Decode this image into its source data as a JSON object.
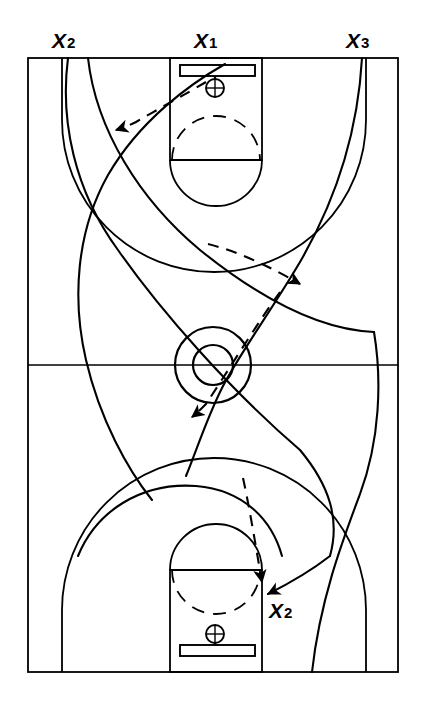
{
  "diagram": {
    "type": "basketball-play-diagram",
    "orientation": "vertical-full-court",
    "line_color": "#000000",
    "background_color": "#ffffff",
    "court": {
      "boundary": {
        "x": 28,
        "y": 58,
        "width": 370,
        "height": 614
      },
      "half_court_line_y": 365,
      "center_circle": {
        "cx": 213,
        "cy": 365,
        "outer_r": 38,
        "inner_r": 20
      },
      "top_basket": {
        "key": {
          "x": 170,
          "y": 58,
          "width": 92,
          "height": 102
        },
        "free_throw_line_y": 160,
        "free_throw_circle": {
          "cx": 216,
          "cy": 160,
          "r": 46
        },
        "backboard": {
          "x": 180,
          "y": 65,
          "width": 75,
          "height": 11
        },
        "hoop": {
          "cx": 215,
          "cy": 88,
          "r": 9
        },
        "three_point_arc": {
          "cx": 214,
          "cy": 80,
          "r": 152
        }
      },
      "bottom_basket": {
        "key": {
          "x": 170,
          "y": 570,
          "width": 92,
          "height": 102
        },
        "free_throw_line_y": 570,
        "free_throw_circle": {
          "cx": 216,
          "cy": 570,
          "r": 46
        },
        "backboard": {
          "x": 180,
          "y": 645,
          "width": 75,
          "height": 11
        },
        "hoop": {
          "cx": 215,
          "cy": 634,
          "r": 9
        },
        "three_point_arc": {
          "cx": 214,
          "cy": 650,
          "r": 152
        }
      }
    },
    "labels": [
      {
        "id": "x2-top",
        "x_text": "X",
        "number": "2",
        "full": "X2",
        "position": "top-left-baseline"
      },
      {
        "id": "x1-top",
        "x_text": "X",
        "number": "1",
        "full": "X1",
        "position": "top-center-baseline"
      },
      {
        "id": "x3-top",
        "x_text": "X",
        "number": "3",
        "full": "X3",
        "position": "top-right-baseline"
      },
      {
        "id": "x2-bottom",
        "x_text": "X",
        "number": "2",
        "full": "X2",
        "position": "bottom-right-key"
      }
    ],
    "movement_paths": [
      {
        "id": "path-x2-a",
        "style": "solid",
        "description": "X2 cut from top-left baseline sweeping down and right across the court"
      },
      {
        "id": "path-x2-b",
        "style": "solid",
        "description": "X2 second curve from top-left baseline bending right to mid court"
      },
      {
        "id": "path-x1",
        "style": "solid",
        "description": "X1 curl from top key arcing left then down to lower left"
      },
      {
        "id": "path-x3",
        "style": "solid",
        "description": "X3 cut from top-right baseline sweeping left then down to bottom right"
      },
      {
        "id": "path-bottom-right",
        "style": "solid",
        "description": "Solid arc from lower left rising to the bottom-right key arrow"
      }
    ],
    "pass_routes": [
      {
        "id": "pass-1",
        "style": "dashed",
        "arrow": "left",
        "description": "Pass from top hoop area to the left wing"
      },
      {
        "id": "pass-2",
        "style": "dashed",
        "arrow": "right",
        "description": "Pass across from left wing to right wing above mid court"
      },
      {
        "id": "pass-3",
        "style": "dashed",
        "arrow": "down-left",
        "description": "Pass from right wing down through the center circle to the left"
      },
      {
        "id": "pass-4",
        "style": "dashed",
        "arrow": "down",
        "description": "Pass down into the bottom right block to X2"
      }
    ]
  }
}
